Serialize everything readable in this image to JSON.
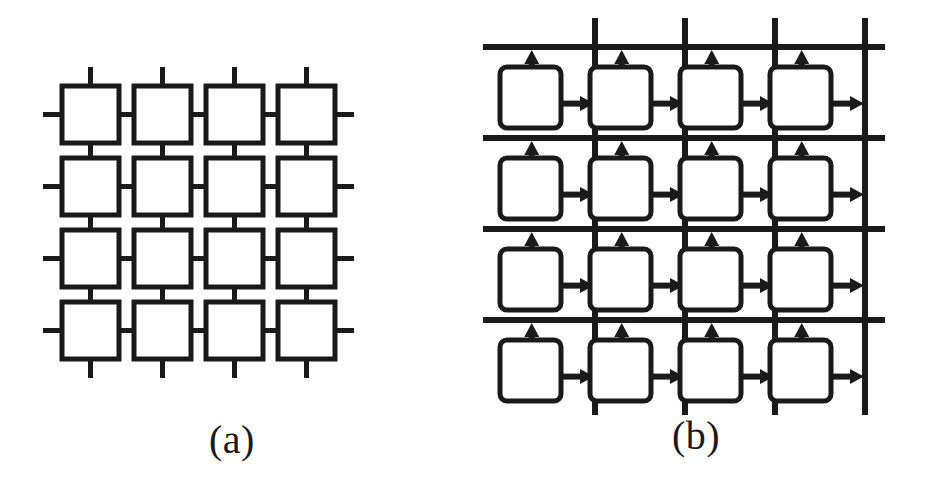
{
  "figure": {
    "background_color": "#ffffff",
    "ink_color": "#1a1a1a",
    "width": 928,
    "height": 497
  },
  "panels": [
    {
      "id": "a",
      "caption": "(a)",
      "topology_name": "mesh",
      "node_shape": "square",
      "node_count": 16,
      "rows": 4,
      "columns": 4,
      "link_style": "plain-line",
      "link_direction": "bidirectional",
      "has_edge_stubs": true,
      "geometry": {
        "origin_x": 62,
        "origin_y": 86,
        "box_size": 57,
        "pitch": 72,
        "stroke": 5,
        "corner_radius": 0,
        "stub_length": 19
      }
    },
    {
      "id": "b",
      "caption": "(b)",
      "topology_name": "bus-grid",
      "node_shape": "rounded-square",
      "node_count": 16,
      "rows": 4,
      "columns": 4,
      "link_style": "arrow",
      "link_direction": "unidirectional",
      "arrow_directions": [
        "up",
        "right"
      ],
      "bus_lines": {
        "horizontal_count": 4,
        "vertical_count": 4,
        "horizontal_y": [
          47,
          138,
          229,
          320
        ],
        "vertical_x": [
          131,
          221,
          311,
          401
        ],
        "horizontal_span": [
          19,
          421
        ],
        "vertical_span": [
          18,
          415
        ],
        "stroke": 6
      },
      "geometry": {
        "box_left": [
          36,
          126,
          216,
          306
        ],
        "box_top": [
          67,
          158,
          249,
          340
        ],
        "box_w": 61,
        "box_h": 61,
        "stroke": 5,
        "corner_radius": 7
      }
    }
  ],
  "chart_data": {
    "type": "diagram",
    "title": "",
    "subtitle": "",
    "panels": [
      {
        "label": "(a)",
        "nodes": 16,
        "grid": [
          4,
          4
        ],
        "edges": "bidirectional nearest-neighbour mesh links plus open stubs on all four borders"
      },
      {
        "label": "(b)",
        "nodes": 16,
        "grid": [
          4,
          4
        ],
        "edges": "each node drives one upward arrow onto the horizontal bus above it and one rightward arrow onto the vertical bus to its right"
      }
    ]
  }
}
